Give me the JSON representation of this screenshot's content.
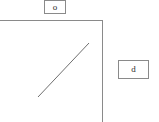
{
  "canvas": {
    "width": 159,
    "height": 122,
    "background": "#ffffff",
    "stroke_color": "#8a8a8a",
    "text_color": "#2b2b2b"
  },
  "labels": {
    "top": {
      "text": "o",
      "name": "label-box-o",
      "x": 44,
      "y": 0,
      "width": 22,
      "height": 14
    },
    "right": {
      "text": "d",
      "name": "label-box-d",
      "x": 118,
      "y": 60,
      "width": 31,
      "height": 19
    }
  },
  "shapes": {
    "horizontal_line": {
      "name": "horizontal-line",
      "x1": 0,
      "y1": 20,
      "x2": 102,
      "y2": 20
    },
    "vertical_line": {
      "name": "vertical-line",
      "x1": 102,
      "y1": 20,
      "x2": 102,
      "y2": 122
    },
    "diagonal_line": {
      "name": "diagonal-line",
      "x1": 38,
      "y1": 97,
      "x2": 89,
      "y2": 43
    }
  }
}
